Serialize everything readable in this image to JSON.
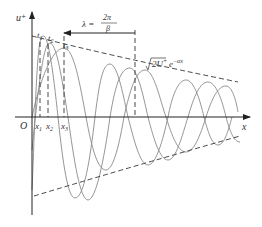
{
  "diagram": {
    "type": "decaying traveling wave",
    "axes": {
      "y_label": "u⁺",
      "x_label": "x",
      "origin_label": "O"
    },
    "x_ticks": [
      {
        "label": "x",
        "sub": "1"
      },
      {
        "label": "x",
        "sub": "2"
      },
      {
        "label": "x",
        "sub": "3"
      }
    ],
    "time_labels": [
      {
        "label": "t",
        "sub": "1"
      },
      {
        "label": "t",
        "sub": "2"
      },
      {
        "label": "t",
        "sub": "3"
      }
    ],
    "wavelength": {
      "lhs": "λ =",
      "numerator": "2π",
      "denominator": "β"
    },
    "envelope": {
      "prefix": "√",
      "body": "2U",
      "sup1": "+",
      "exp_base": "e",
      "exp_power": "−αx"
    },
    "colors": {
      "wave": "#8a8a8a",
      "axis": "#222222",
      "text": "#333333"
    }
  }
}
